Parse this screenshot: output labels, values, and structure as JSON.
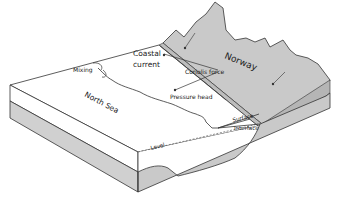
{
  "diagram": {
    "type": "block-diagram",
    "labels": {
      "norway": "Norway",
      "coastal_current_line1": "Coastal",
      "coastal_current_line2": "current",
      "coriolis_force": "Coriolis force",
      "pressure_head": "Pressure head",
      "mixing": "Mixing",
      "north_sea": "North Sea",
      "level": "Level",
      "surface": "Surface",
      "interface": "Interface"
    },
    "colors": {
      "land": "#c9c9c9",
      "land_side": "#bdbdbd",
      "sea_top": "#ffffff",
      "lower_layer": "#d0d0d0",
      "line": "#333333"
    }
  }
}
